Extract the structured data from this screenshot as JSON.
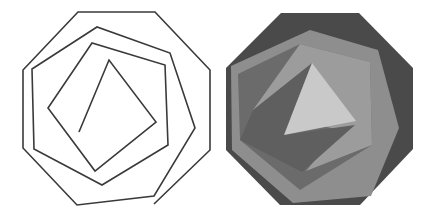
{
  "figure": {
    "left_panel": {
      "name": "spiral-line-drawing",
      "stroke_color": "#3a3a3a",
      "stroke_width": 1.6,
      "spiral_points": [
        [
          154,
          204
        ],
        [
          210,
          150
        ],
        [
          210,
          70
        ],
        [
          155,
          12
        ],
        [
          78,
          12
        ],
        [
          23,
          70
        ],
        [
          23,
          148
        ],
        [
          77,
          205
        ],
        [
          154,
          196
        ],
        [
          195,
          128
        ],
        [
          170,
          53
        ],
        [
          97,
          27
        ],
        [
          32,
          69
        ],
        [
          34,
          149
        ],
        [
          102,
          185
        ],
        [
          168,
          145
        ],
        [
          165,
          65
        ],
        [
          92,
          43
        ],
        [
          48,
          108
        ],
        [
          95,
          171
        ],
        [
          156,
          122
        ],
        [
          109,
          60
        ],
        [
          79,
          132
        ]
      ]
    },
    "right_panel": {
      "name": "shaded-polygon-rendering",
      "colors": {
        "octagon": "#4a4a4a",
        "heptagon": "#8e8e8e",
        "hexagon": "#6b6b6b",
        "pentagon": "#9c9c9c",
        "quad": "#5f5f5f",
        "triangle": "#c9c9c9"
      },
      "octagon": [
        [
          281,
          13
        ],
        [
          359,
          13
        ],
        [
          413,
          68
        ],
        [
          413,
          149
        ],
        [
          360,
          205
        ],
        [
          280,
          205
        ],
        [
          226,
          150
        ],
        [
          226,
          68
        ]
      ],
      "heptagon": [
        [
          310,
          30
        ],
        [
          378,
          50
        ],
        [
          399,
          128
        ],
        [
          371,
          196
        ],
        [
          293,
          203
        ],
        [
          232,
          150
        ],
        [
          231,
          66
        ]
      ],
      "hexagon": [
        [
          300,
          44
        ],
        [
          370,
          62
        ],
        [
          372,
          145
        ],
        [
          300,
          190
        ],
        [
          240,
          140
        ],
        [
          238,
          74
        ]
      ],
      "pentagon": [
        [
          300,
          44
        ],
        [
          370,
          62
        ],
        [
          372,
          145
        ],
        [
          306,
          171
        ],
        [
          340,
          130
        ],
        [
          253,
          110
        ]
      ],
      "quad": [
        [
          253,
          110
        ],
        [
          312,
          63
        ],
        [
          284,
          135
        ],
        [
          355,
          125
        ],
        [
          302,
          172
        ],
        [
          240,
          140
        ]
      ],
      "triangle": [
        [
          312,
          63
        ],
        [
          356,
          121
        ],
        [
          284,
          135
        ]
      ]
    }
  }
}
